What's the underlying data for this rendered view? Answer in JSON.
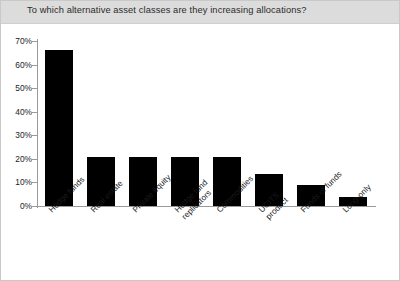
{
  "chart_data": {
    "type": "bar",
    "title": "To which alternative asset classes are they increasing allocations?",
    "xlabel": "",
    "ylabel": "",
    "ylim": [
      0,
      70
    ],
    "ytick_labels": [
      "70%",
      "60%",
      "50%",
      "40%",
      "30%",
      "20%",
      "10%",
      "0%"
    ],
    "ytick_values": [
      70,
      60,
      50,
      40,
      30,
      20,
      10,
      0
    ],
    "grid": false,
    "legend": "none",
    "bar_color": "#000000",
    "categories": [
      "Hedge funds",
      "Real estate",
      "Private equity",
      "Hedge fund replicators",
      "Commodities",
      "UCITS product",
      "Funds of funds",
      "Long-only"
    ],
    "category_lines": [
      [
        "Hedge funds"
      ],
      [
        "Real estate"
      ],
      [
        "Private equity"
      ],
      [
        "Hedge fund",
        "replicators"
      ],
      [
        "Commodities"
      ],
      [
        "UCITS",
        "product"
      ],
      [
        "Funds of funds"
      ],
      [
        "Long-only"
      ]
    ],
    "values": [
      66,
      21,
      21,
      21,
      21,
      13.5,
      9,
      4
    ]
  },
  "style": {
    "title_band_color": "#dcdcdc",
    "axis_color": "#9a9a9a",
    "background": "#ffffff",
    "border_color": "#c9c9c9"
  }
}
